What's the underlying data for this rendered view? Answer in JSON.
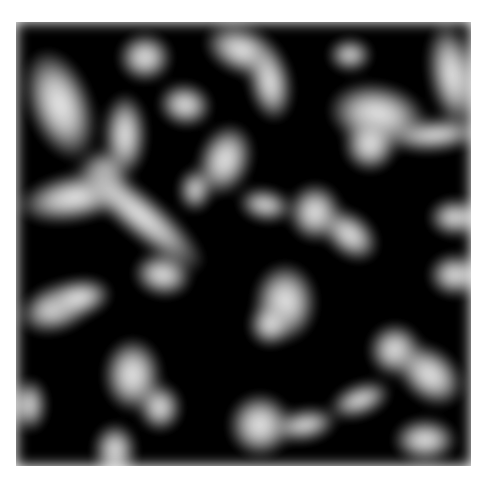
{
  "image": {
    "description": "Grayscale microscopy-like texture of bright worm-like blobs on a black background",
    "background_color": "#050505",
    "blob_color": "#e6e6e6",
    "frame": {
      "left": 16,
      "top": 22,
      "width": 455,
      "height": 444
    },
    "blobs": [
      {
        "x": 30,
        "y": 50,
        "w": 60,
        "h": 110,
        "r": -20
      },
      {
        "x": 120,
        "y": 35,
        "w": 50,
        "h": 45,
        "r": 0
      },
      {
        "x": 205,
        "y": 28,
        "w": 75,
        "h": 45,
        "r": 20
      },
      {
        "x": 250,
        "y": 45,
        "w": 40,
        "h": 75,
        "r": -10
      },
      {
        "x": 330,
        "y": 40,
        "w": 40,
        "h": 30,
        "r": 0
      },
      {
        "x": 430,
        "y": 25,
        "w": 45,
        "h": 100,
        "r": -10
      },
      {
        "x": 330,
        "y": 85,
        "w": 95,
        "h": 60,
        "r": 10
      },
      {
        "x": 345,
        "y": 120,
        "w": 50,
        "h": 50,
        "r": 0
      },
      {
        "x": 390,
        "y": 120,
        "w": 90,
        "h": 30,
        "r": -5
      },
      {
        "x": 105,
        "y": 95,
        "w": 40,
        "h": 80,
        "r": 0
      },
      {
        "x": 160,
        "y": 85,
        "w": 50,
        "h": 40,
        "r": 10
      },
      {
        "x": 200,
        "y": 125,
        "w": 50,
        "h": 70,
        "r": 20
      },
      {
        "x": 85,
        "y": 150,
        "w": 40,
        "h": 50,
        "r": -30
      },
      {
        "x": 20,
        "y": 175,
        "w": 110,
        "h": 45,
        "r": -10
      },
      {
        "x": 60,
        "y": 195,
        "w": 160,
        "h": 40,
        "r": 40
      },
      {
        "x": 135,
        "y": 255,
        "w": 55,
        "h": 40,
        "r": 10
      },
      {
        "x": 240,
        "y": 190,
        "w": 50,
        "h": 30,
        "r": 10
      },
      {
        "x": 290,
        "y": 185,
        "w": 50,
        "h": 55,
        "r": 0
      },
      {
        "x": 320,
        "y": 215,
        "w": 60,
        "h": 40,
        "r": 40
      },
      {
        "x": 430,
        "y": 200,
        "w": 50,
        "h": 35,
        "r": 0
      },
      {
        "x": 430,
        "y": 255,
        "w": 50,
        "h": 40,
        "r": 0
      },
      {
        "x": 255,
        "y": 265,
        "w": 60,
        "h": 75,
        "r": 0
      },
      {
        "x": 250,
        "y": 305,
        "w": 40,
        "h": 40,
        "r": 0
      },
      {
        "x": 20,
        "y": 285,
        "w": 75,
        "h": 45,
        "r": -20
      },
      {
        "x": 50,
        "y": 280,
        "w": 60,
        "h": 35,
        "r": -10
      },
      {
        "x": 105,
        "y": 340,
        "w": 55,
        "h": 70,
        "r": 0
      },
      {
        "x": 140,
        "y": 385,
        "w": 40,
        "h": 45,
        "r": 0
      },
      {
        "x": 15,
        "y": 380,
        "w": 30,
        "h": 50,
        "r": 0
      },
      {
        "x": 370,
        "y": 325,
        "w": 50,
        "h": 50,
        "r": 0
      },
      {
        "x": 395,
        "y": 350,
        "w": 70,
        "h": 50,
        "r": 40
      },
      {
        "x": 230,
        "y": 395,
        "w": 60,
        "h": 60,
        "r": 0
      },
      {
        "x": 275,
        "y": 410,
        "w": 60,
        "h": 30,
        "r": -10
      },
      {
        "x": 330,
        "y": 385,
        "w": 60,
        "h": 30,
        "r": -20
      },
      {
        "x": 95,
        "y": 425,
        "w": 40,
        "h": 50,
        "r": 0
      },
      {
        "x": 395,
        "y": 420,
        "w": 60,
        "h": 40,
        "r": 0
      },
      {
        "x": 180,
        "y": 170,
        "w": 30,
        "h": 40,
        "r": 0
      }
    ]
  }
}
